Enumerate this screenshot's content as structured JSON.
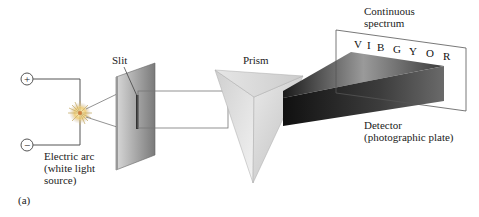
{
  "labels": {
    "slit": "Slit",
    "prism": "Prism",
    "spectrum_line1": "Continuous",
    "spectrum_line2": "spectrum",
    "detector_line1": "Detector",
    "detector_line2": "(photographic plate)",
    "arc_line1": "Electric arc",
    "arc_line2": "(white light",
    "arc_line3": "source)",
    "panel": "(a)",
    "plus": "+",
    "minus": "−"
  },
  "spectrum_letters": [
    "V",
    "I",
    "B",
    "G",
    "Y",
    "O",
    "R"
  ]
}
